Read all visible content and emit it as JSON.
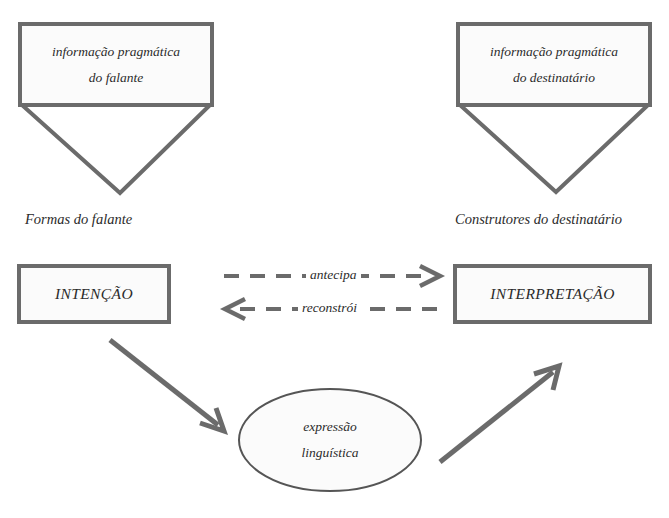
{
  "diagram": {
    "colors": {
      "stroke": "#6b6b6b",
      "text": "#2b2b2b",
      "background": "#ffffff",
      "box_fill": "#fbfbfb"
    },
    "nodes": {
      "speaker_pragmatic_info": {
        "line1": "informação pragmática",
        "line2": "do falante"
      },
      "addressee_pragmatic_info": {
        "line1": "informação pragmática",
        "line2": "do destinatário"
      },
      "speaker_caption": "Formas do falante",
      "addressee_caption": "Construtores do destinatário",
      "intention": "INTENÇÃO",
      "interpretation": "INTERPRETAÇÃO",
      "linguistic_expression": {
        "line1": "expressão",
        "line2": "linguística"
      }
    },
    "edges": {
      "anticipates": "antecipa",
      "reconstructs": "reconstrói"
    }
  }
}
